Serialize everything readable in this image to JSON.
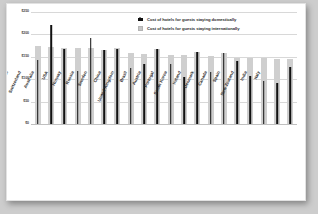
{
  "chart_data": {
    "type": "bar",
    "title": "",
    "subtitle": "",
    "xlabel": "",
    "ylabel": "",
    "ylim": [
      0,
      250
    ],
    "ytick_values": [
      0,
      50,
      100,
      150,
      200,
      250
    ],
    "ytick_labels": [
      "$0",
      "$50",
      "$100",
      "$150",
      "$200",
      "$250"
    ],
    "grid": true,
    "legend_position": "top-right",
    "categories": [
      "Japan",
      "Switzerland",
      "Australia",
      "USA",
      "Norway",
      "Russia",
      "Sweden",
      "China",
      "United Kingdom",
      "Brazil",
      "Austria",
      "Portugal",
      "South Korea",
      "Ireland",
      "Denmark",
      "Canada",
      "Spain",
      "New Zealand",
      "India",
      "Italy"
    ],
    "series": [
      {
        "name": "Cost of hotels for guests staying domestically",
        "color": "#111111",
        "marker": "house-icon",
        "values": [
          143,
          220,
          168,
          118,
          193,
          165,
          168,
          126,
          134,
          168,
          133,
          105,
          160,
          117,
          158,
          140,
          108,
          96,
          92,
          127
        ]
      },
      {
        "name": "Cost of hotels for guests staying internationally",
        "color": "#cfcfcf",
        "marker": "grey-square",
        "values": [
          175,
          172,
          170,
          170,
          170,
          166,
          169,
          158,
          157,
          168,
          154,
          153,
          160,
          152,
          158,
          147,
          147,
          147,
          145,
          146
        ]
      }
    ]
  },
  "legend": {
    "items": [
      {
        "label": "Cost of hotels for guests staying domestically",
        "icon": "house-icon"
      },
      {
        "label": "Cost of hotels for guests staying internationally",
        "icon": "grey-square-icon"
      }
    ]
  },
  "colors": {
    "domestic": "#111111",
    "international": "#cfcfcf",
    "grid": "#d8d8d8",
    "card": "#ffffff",
    "backdrop": "#cdcdcd"
  }
}
